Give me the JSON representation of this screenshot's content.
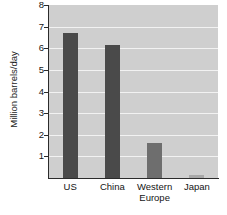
{
  "chart_data": {
    "type": "bar",
    "title": "",
    "xlabel": "",
    "ylabel": "Million barrels/day",
    "categories": [
      "US",
      "China",
      "Western\nEurope",
      "Japan"
    ],
    "values": [
      6.7,
      6.15,
      1.6,
      0.12
    ],
    "ylim": [
      0,
      8
    ],
    "yticks": [
      1,
      2,
      3,
      4,
      5,
      6,
      7,
      8
    ],
    "ytick_labels": [
      "1",
      "2",
      "3",
      "4",
      "5",
      "6",
      "7",
      "8"
    ],
    "grid": true,
    "legend": "none",
    "colors": {
      "bar_dark": "#4a4a4a",
      "bar_light": "#6e6e6e",
      "bar_japan": "#a8a8a8",
      "plot_background": "#cfcfcf",
      "gridline": "#f2f2f2",
      "axis": "#2b2b2b",
      "text": "#141414",
      "page_background": "#ffffff"
    },
    "bar_colors": [
      "#4a4a4a",
      "#4a4a4a",
      "#6e6e6e",
      "#a8a8a8"
    ]
  }
}
